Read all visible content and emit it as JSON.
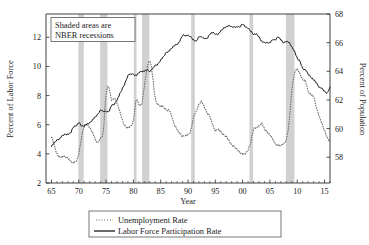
{
  "chart_data": {
    "type": "line",
    "title": "",
    "subtitle": "",
    "xlabel": "Year",
    "ylabel": "Percent of Labor Force",
    "ylabel_right": "Percent of Population",
    "xlim": [
      1964.0,
      2016.0
    ],
    "ylim_left": [
      2,
      13.6
    ],
    "ylim_right": [
      56.2,
      68.0
    ],
    "grid": false,
    "legend_position": "bottom-center",
    "xticks": [
      1965,
      1970,
      1975,
      1980,
      1985,
      1990,
      1995,
      2000,
      2005,
      2010,
      2015
    ],
    "xticklabels": [
      "65",
      "70",
      "75",
      "80",
      "85",
      "90",
      "95",
      "00",
      "05",
      "10",
      "15"
    ],
    "yticks_left": [
      2,
      4,
      6,
      8,
      10,
      12
    ],
    "yticklabels_left": [
      "2",
      "4",
      "6",
      "8",
      "10",
      "12"
    ],
    "yticks_right": [
      58,
      60,
      62,
      64,
      66,
      68
    ],
    "yticklabels_right": [
      "58",
      "60",
      "62",
      "64",
      "66",
      "68"
    ],
    "annotation": {
      "line1": "Shaded areas are",
      "line2": "NBER recessions"
    },
    "legend": [
      {
        "label": "Unemployment Rate",
        "style": "dotted",
        "color": "#6e6e6e",
        "axis": "left"
      },
      {
        "label": "Labor Force Participation Rate",
        "style": "solid",
        "color": "#1a1a1a",
        "axis": "right"
      }
    ],
    "recessions": [
      {
        "start": 1969.92,
        "end": 1970.92
      },
      {
        "start": 1973.92,
        "end": 1975.25
      },
      {
        "start": 1980.08,
        "end": 1980.58
      },
      {
        "start": 1981.58,
        "end": 1982.92
      },
      {
        "start": 1990.58,
        "end": 1991.25
      },
      {
        "start": 2001.25,
        "end": 2001.92
      },
      {
        "start": 2007.92,
        "end": 2009.5
      }
    ],
    "series": [
      {
        "name": "Unemployment Rate",
        "axis": "left",
        "units": "percent of labor force",
        "x": [
          1965.0,
          1965.5,
          1966.0,
          1966.5,
          1967.0,
          1967.5,
          1968.0,
          1968.5,
          1969.0,
          1969.5,
          1970.0,
          1970.5,
          1971.0,
          1971.5,
          1972.0,
          1972.5,
          1973.0,
          1973.5,
          1974.0,
          1974.5,
          1975.0,
          1975.5,
          1976.0,
          1976.5,
          1977.0,
          1977.5,
          1978.0,
          1978.5,
          1979.0,
          1979.5,
          1980.0,
          1980.5,
          1981.0,
          1981.5,
          1982.0,
          1982.5,
          1983.0,
          1983.5,
          1984.0,
          1984.5,
          1985.0,
          1985.5,
          1986.0,
          1986.5,
          1987.0,
          1987.5,
          1988.0,
          1988.5,
          1989.0,
          1989.5,
          1990.0,
          1990.5,
          1991.0,
          1991.5,
          1992.0,
          1992.5,
          1993.0,
          1993.5,
          1994.0,
          1994.5,
          1995.0,
          1995.5,
          1996.0,
          1996.5,
          1997.0,
          1997.5,
          1998.0,
          1998.5,
          1999.0,
          1999.5,
          2000.0,
          2000.5,
          2001.0,
          2001.5,
          2002.0,
          2002.5,
          2003.0,
          2003.5,
          2004.0,
          2004.5,
          2005.0,
          2005.5,
          2006.0,
          2006.5,
          2007.0,
          2007.5,
          2008.0,
          2008.5,
          2009.0,
          2009.5,
          2010.0,
          2010.5,
          2011.0,
          2011.5,
          2012.0,
          2012.5,
          2013.0,
          2013.5,
          2014.0,
          2014.5,
          2015.0,
          2015.5,
          2016.0
        ],
        "y": [
          5.2,
          4.6,
          4.0,
          3.8,
          3.8,
          3.8,
          3.7,
          3.5,
          3.4,
          3.5,
          4.0,
          5.1,
          5.9,
          6.0,
          5.8,
          5.5,
          5.0,
          4.8,
          5.1,
          5.6,
          8.1,
          8.6,
          7.7,
          7.8,
          7.5,
          6.9,
          6.3,
          5.9,
          5.8,
          5.9,
          6.3,
          7.7,
          7.4,
          7.4,
          8.6,
          9.8,
          10.4,
          9.4,
          7.8,
          7.4,
          7.3,
          7.2,
          7.0,
          7.0,
          6.6,
          6.0,
          5.7,
          5.4,
          5.2,
          5.3,
          5.3,
          5.6,
          6.5,
          6.9,
          7.4,
          7.6,
          7.2,
          6.8,
          6.6,
          6.0,
          5.6,
          5.7,
          5.5,
          5.3,
          5.2,
          4.9,
          4.6,
          4.5,
          4.3,
          4.1,
          4.0,
          4.0,
          4.3,
          4.8,
          5.7,
          5.8,
          5.9,
          6.1,
          5.7,
          5.5,
          5.3,
          5.0,
          4.7,
          4.6,
          4.6,
          4.7,
          5.0,
          6.1,
          8.3,
          9.5,
          9.8,
          9.5,
          9.1,
          9.0,
          8.3,
          8.1,
          7.9,
          7.2,
          6.6,
          6.1,
          5.6,
          5.1,
          4.9
        ]
      },
      {
        "name": "Labor Force Participation Rate",
        "axis": "right",
        "units": "percent of population",
        "x": [
          1965.0,
          1965.5,
          1966.0,
          1966.5,
          1967.0,
          1967.5,
          1968.0,
          1968.5,
          1969.0,
          1969.5,
          1970.0,
          1970.5,
          1971.0,
          1971.5,
          1972.0,
          1972.5,
          1973.0,
          1973.5,
          1974.0,
          1974.5,
          1975.0,
          1975.5,
          1976.0,
          1976.5,
          1977.0,
          1977.5,
          1978.0,
          1978.5,
          1979.0,
          1979.5,
          1980.0,
          1980.5,
          1981.0,
          1981.5,
          1982.0,
          1982.5,
          1983.0,
          1983.5,
          1984.0,
          1984.5,
          1985.0,
          1985.5,
          1986.0,
          1986.5,
          1987.0,
          1987.5,
          1988.0,
          1988.5,
          1989.0,
          1989.5,
          1990.0,
          1990.5,
          1991.0,
          1991.5,
          1992.0,
          1992.5,
          1993.0,
          1993.5,
          1994.0,
          1994.5,
          1995.0,
          1995.5,
          1996.0,
          1996.5,
          1997.0,
          1997.5,
          1998.0,
          1998.5,
          1999.0,
          1999.5,
          2000.0,
          2000.5,
          2001.0,
          2001.5,
          2002.0,
          2002.5,
          2003.0,
          2003.5,
          2004.0,
          2004.5,
          2005.0,
          2005.5,
          2006.0,
          2006.5,
          2007.0,
          2007.5,
          2008.0,
          2008.5,
          2009.0,
          2009.5,
          2010.0,
          2010.5,
          2011.0,
          2011.5,
          2012.0,
          2012.5,
          2013.0,
          2013.5,
          2014.0,
          2014.5,
          2015.0,
          2015.5,
          2016.0
        ],
        "y": [
          58.8,
          59.0,
          59.2,
          59.3,
          59.5,
          59.6,
          59.6,
          59.7,
          60.1,
          60.2,
          60.4,
          60.2,
          60.2,
          60.3,
          60.4,
          60.6,
          60.8,
          61.0,
          61.3,
          61.2,
          61.2,
          61.2,
          61.6,
          61.7,
          62.0,
          62.4,
          62.8,
          63.2,
          63.7,
          63.8,
          63.8,
          63.7,
          63.9,
          64.0,
          64.0,
          64.1,
          64.0,
          64.2,
          64.4,
          64.5,
          64.8,
          65.0,
          65.3,
          65.4,
          65.6,
          65.8,
          65.9,
          66.1,
          66.5,
          66.5,
          66.5,
          66.4,
          66.2,
          66.1,
          66.4,
          66.4,
          66.3,
          66.3,
          66.6,
          66.7,
          66.6,
          66.6,
          66.8,
          67.0,
          67.1,
          67.2,
          67.1,
          67.1,
          67.1,
          67.1,
          67.3,
          67.1,
          67.0,
          66.8,
          66.6,
          66.6,
          66.4,
          66.1,
          66.0,
          66.0,
          66.0,
          66.2,
          66.2,
          66.4,
          66.2,
          66.0,
          66.1,
          66.0,
          65.7,
          65.4,
          64.9,
          64.7,
          64.2,
          64.1,
          63.8,
          63.6,
          63.4,
          63.2,
          62.9,
          62.8,
          62.6,
          62.5,
          62.9
        ]
      }
    ]
  },
  "plot_geometry": {
    "left": 46,
    "right": 330,
    "top": 14,
    "bottom": 183
  },
  "colors": {
    "axis": "#2b2b2b",
    "unemployment": "#6e6e6e",
    "participation": "#1a1a1a",
    "recession_band": "#c9c9c9",
    "background": "#ffffff"
  }
}
